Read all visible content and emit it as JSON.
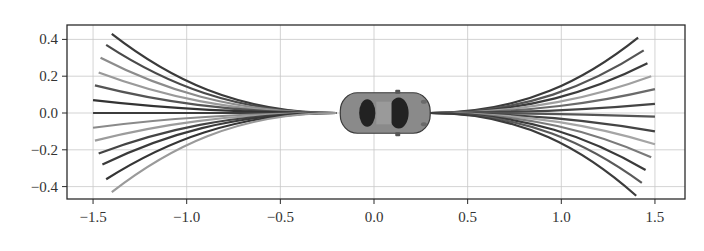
{
  "chart_data": {
    "type": "line",
    "title": "",
    "xlabel": "",
    "ylabel": "",
    "xlim": [
      -1.64,
      1.66
    ],
    "ylim": [
      -0.47,
      0.48
    ],
    "grid": true,
    "legend": null,
    "x_ticks": [
      -1.5,
      -1.0,
      -0.5,
      0.0,
      0.5,
      1.0,
      1.5
    ],
    "x_tick_labels": [
      "−1.5",
      "−1.0",
      "−0.5",
      "0.0",
      "0.5",
      "1.0",
      "1.5"
    ],
    "y_ticks": [
      0.4,
      0.2,
      0.0,
      -0.2,
      -0.4
    ],
    "y_tick_labels": [
      "0.4",
      "0.2",
      "0.0",
      "−0.2",
      "−0.4"
    ],
    "annotation": {
      "type": "vehicle-top-view",
      "center": [
        0.06,
        0.0
      ],
      "length": 0.48,
      "width": 0.22,
      "body_color": "#8a8a8a",
      "window_color": "#222222"
    },
    "series": [
      {
        "name": "backward-fan",
        "origin": [
          -0.2,
          0.0
        ],
        "end_points": [
          [
            -1.4,
            0.43
          ],
          [
            -1.43,
            0.37
          ],
          [
            -1.46,
            0.3
          ],
          [
            -1.47,
            0.22
          ],
          [
            -1.49,
            0.15
          ],
          [
            -1.5,
            0.07
          ],
          [
            -1.5,
            0.0
          ],
          [
            -1.5,
            -0.08
          ],
          [
            -1.49,
            -0.15
          ],
          [
            -1.47,
            -0.22
          ],
          [
            -1.45,
            -0.28
          ],
          [
            -1.43,
            -0.36
          ],
          [
            -1.4,
            -0.43
          ]
        ],
        "colors": [
          "#3a3a3a",
          "#4a4a4a",
          "#8c8c8c",
          "#9a9a9a",
          "#555555",
          "#333333",
          "#3c3c3c",
          "#8a8a8a",
          "#9c9c9c",
          "#444444",
          "#3a3a3a",
          "#353535",
          "#9a9a9a"
        ]
      },
      {
        "name": "forward-fan",
        "origin": [
          0.3,
          0.0
        ],
        "end_points": [
          [
            1.41,
            0.41
          ],
          [
            1.44,
            0.34
          ],
          [
            1.46,
            0.27
          ],
          [
            1.48,
            0.2
          ],
          [
            1.5,
            0.13
          ],
          [
            1.5,
            0.05
          ],
          [
            1.5,
            -0.02
          ],
          [
            1.5,
            -0.1
          ],
          [
            1.5,
            -0.17
          ],
          [
            1.48,
            -0.24
          ],
          [
            1.45,
            -0.31
          ],
          [
            1.43,
            -0.38
          ],
          [
            1.4,
            -0.45
          ]
        ],
        "colors": [
          "#3a3a3a",
          "#555555",
          "#3c3c3c",
          "#a0a0a0",
          "#6a6a6a",
          "#444444",
          "#555555",
          "#444444",
          "#a5a5a5",
          "#7a7a7a",
          "#3a3a3a",
          "#5a5a5a",
          "#3c3c3c"
        ]
      }
    ]
  },
  "plot_area": {
    "left": 67,
    "top": 25,
    "right": 685,
    "bottom": 199
  },
  "axis_map": {
    "x0_px": 374,
    "px_per_unit_x": 187.3,
    "y0_px": 113,
    "px_per_unit_y": 184
  },
  "colors": {
    "frame": "#2b2b2b",
    "grid": "#c8c8c8",
    "tick_text": "#333333"
  }
}
